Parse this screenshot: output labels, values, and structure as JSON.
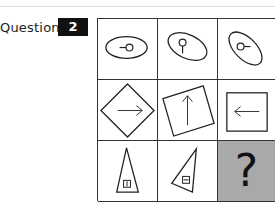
{
  "header": {
    "question_label": "Question",
    "question_number": "2"
  },
  "puzzle": {
    "rows": 3,
    "cols": 3,
    "cells": [
      {
        "row": 0,
        "col": 0,
        "shape": "ellipse-horizontal-with-circle-and-left-line"
      },
      {
        "row": 0,
        "col": 1,
        "shape": "ellipse-tilted-with-circle-and-down-line"
      },
      {
        "row": 0,
        "col": 2,
        "shape": "ellipse-steep-with-circle-and-right-line"
      },
      {
        "row": 1,
        "col": 0,
        "shape": "diamond-with-right-arrow"
      },
      {
        "row": 1,
        "col": 1,
        "shape": "tilted-square-with-up-arrow"
      },
      {
        "row": 1,
        "col": 2,
        "shape": "square-with-left-arrow"
      },
      {
        "row": 2,
        "col": 0,
        "shape": "triangle-upright-with-small-square-vertical-line"
      },
      {
        "row": 2,
        "col": 1,
        "shape": "triangle-tilted-with-small-square-horizontal-line"
      },
      {
        "row": 2,
        "col": 2,
        "shape": "unknown",
        "label": "?"
      }
    ],
    "missing_cell_color": "#a9a9a9"
  }
}
